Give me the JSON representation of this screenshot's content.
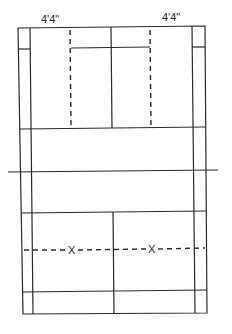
{
  "diagram": {
    "type": "court-diagram",
    "labels": {
      "left_width": "4'4\"",
      "right_width": "4'4\""
    },
    "markers": {
      "left": "X",
      "right": "X"
    },
    "colors": {
      "line": "#2a2a2a",
      "background": "#ffffff"
    }
  }
}
